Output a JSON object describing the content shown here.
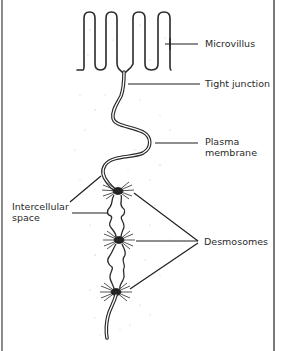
{
  "diagram": {
    "type": "biology-illustration",
    "labels": {
      "microvillus": "Microvillus",
      "tight_junction": "Tight junction",
      "plasma_membrane_line1": "Plasma",
      "plasma_membrane_line2": "membrane",
      "intercellular_line1": "Intercellular",
      "intercellular_line2": "space",
      "desmosomes": "Desmosomes"
    },
    "colors": {
      "ink": "#2a2a2a",
      "border": "#8a8a8a",
      "background": "#ffffff"
    }
  }
}
